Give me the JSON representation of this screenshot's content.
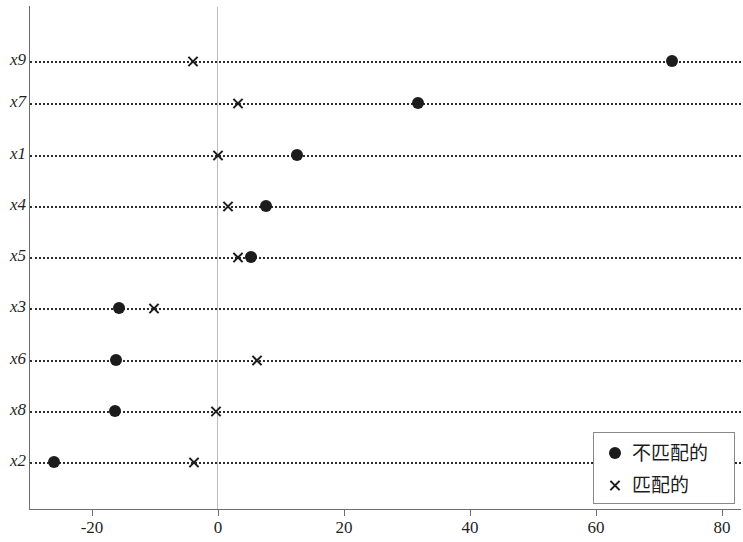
{
  "chart_data": {
    "type": "scatter",
    "title": "",
    "xlabel": "",
    "ylabel": "",
    "orientation": "horizontal",
    "grid": "dotted-horizontal-rows",
    "zero_reference_line": 0,
    "categories": [
      "x9",
      "x7",
      "x1",
      "x4",
      "x5",
      "x3",
      "x6",
      "x8",
      "x2"
    ],
    "xlim": [
      -28,
      82
    ],
    "xticks": [
      -20,
      0,
      20,
      40,
      60,
      80
    ],
    "xticklabels": [
      "-20",
      "0",
      "20",
      "40",
      "60",
      "80"
    ],
    "legend_position": "bottom-right",
    "series": [
      {
        "name": "不匹配的",
        "marker": "filled-circle",
        "color": "#1c1c1c",
        "values": [
          72.0,
          31.7,
          12.5,
          7.6,
          5.2,
          -15.7,
          -16.2,
          -16.3,
          -26.0
        ]
      },
      {
        "name": "匹配的",
        "marker": "cross",
        "color": "#1c1c1c",
        "values": [
          -4.0,
          3.2,
          0.0,
          1.6,
          3.2,
          -10.2,
          6.2,
          -0.3,
          -3.8
        ]
      }
    ]
  },
  "legend": {
    "entries": [
      {
        "label": "不匹配的",
        "marker": "filled-circle"
      },
      {
        "label": "匹配的",
        "marker": "cross"
      }
    ]
  }
}
